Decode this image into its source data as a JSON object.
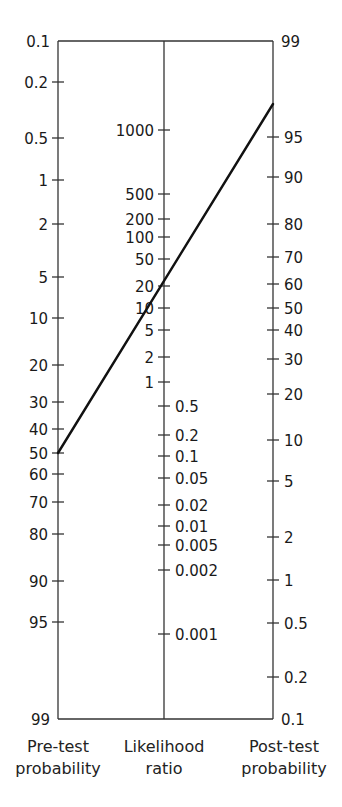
{
  "chart_data": {
    "type": "nomogram",
    "axes": [
      {
        "name": "Pre-test probability",
        "label_line1": "Pre-test",
        "label_line2": "probability",
        "x": 58,
        "label_side": "left",
        "ticks": [
          {
            "label": "0.1",
            "y": 41
          },
          {
            "label": "0.2",
            "y": 82
          },
          {
            "label": "0.5",
            "y": 138
          },
          {
            "label": "1",
            "y": 180
          },
          {
            "label": "2",
            "y": 224
          },
          {
            "label": "5",
            "y": 277
          },
          {
            "label": "10",
            "y": 318
          },
          {
            "label": "20",
            "y": 365
          },
          {
            "label": "30",
            "y": 402
          },
          {
            "label": "40",
            "y": 429
          },
          {
            "label": "50",
            "y": 453
          },
          {
            "label": "60",
            "y": 474
          },
          {
            "label": "70",
            "y": 502
          },
          {
            "label": "80",
            "y": 534
          },
          {
            "label": "90",
            "y": 581
          },
          {
            "label": "95",
            "y": 622
          },
          {
            "label": "99",
            "y": 719
          }
        ]
      },
      {
        "name": "Likelihood ratio",
        "label_line1": "Likelihood",
        "label_line2": "ratio",
        "x": 164,
        "ticks": [
          {
            "label": "1000",
            "y": 130,
            "side": "left"
          },
          {
            "label": "500",
            "y": 194,
            "side": "left"
          },
          {
            "label": "200",
            "y": 219,
            "side": "left"
          },
          {
            "label": "100",
            "y": 237,
            "side": "left"
          },
          {
            "label": "50",
            "y": 259,
            "side": "left"
          },
          {
            "label": "20",
            "y": 286,
            "side": "left"
          },
          {
            "label": "10",
            "y": 308,
            "side": "left"
          },
          {
            "label": "5",
            "y": 330,
            "side": "left"
          },
          {
            "label": "2",
            "y": 357,
            "side": "left"
          },
          {
            "label": "1",
            "y": 382,
            "side": "left"
          },
          {
            "label": "0.5",
            "y": 406,
            "side": "right"
          },
          {
            "label": "0.2",
            "y": 435,
            "side": "right"
          },
          {
            "label": "0.1",
            "y": 456,
            "side": "right"
          },
          {
            "label": "0.05",
            "y": 478,
            "side": "right"
          },
          {
            "label": "0.02",
            "y": 505,
            "side": "right"
          },
          {
            "label": "0.01",
            "y": 526,
            "side": "right"
          },
          {
            "label": "0.005",
            "y": 545,
            "side": "right"
          },
          {
            "label": "0.002",
            "y": 570,
            "side": "right"
          },
          {
            "label": "0.001",
            "y": 634,
            "side": "right"
          }
        ]
      },
      {
        "name": "Post-test probability",
        "label_line1": "Post-test",
        "label_line2": "probability",
        "x": 273,
        "label_side": "right",
        "ticks": [
          {
            "label": "99",
            "y": 41
          },
          {
            "label": "95",
            "y": 137
          },
          {
            "label": "90",
            "y": 177
          },
          {
            "label": "80",
            "y": 224
          },
          {
            "label": "70",
            "y": 257
          },
          {
            "label": "60",
            "y": 284
          },
          {
            "label": "50",
            "y": 308
          },
          {
            "label": "40",
            "y": 330
          },
          {
            "label": "30",
            "y": 359
          },
          {
            "label": "20",
            "y": 394
          },
          {
            "label": "10",
            "y": 440
          },
          {
            "label": "5",
            "y": 481
          },
          {
            "label": "2",
            "y": 537
          },
          {
            "label": "1",
            "y": 580
          },
          {
            "label": "0.5",
            "y": 623
          },
          {
            "label": "0.2",
            "y": 677
          },
          {
            "label": "0.1",
            "y": 719
          }
        ]
      }
    ],
    "frame": {
      "top_y": 41,
      "bottom_y": 719
    },
    "example_line": {
      "pre_test_probability": 50,
      "likelihood_ratio": 20,
      "post_test_probability": 97,
      "x1": 58,
      "y1": 453,
      "x2": 273,
      "y2": 104
    },
    "colors": {
      "axis": "#333333",
      "line": "#111111",
      "text": "#1a1a1a"
    }
  }
}
